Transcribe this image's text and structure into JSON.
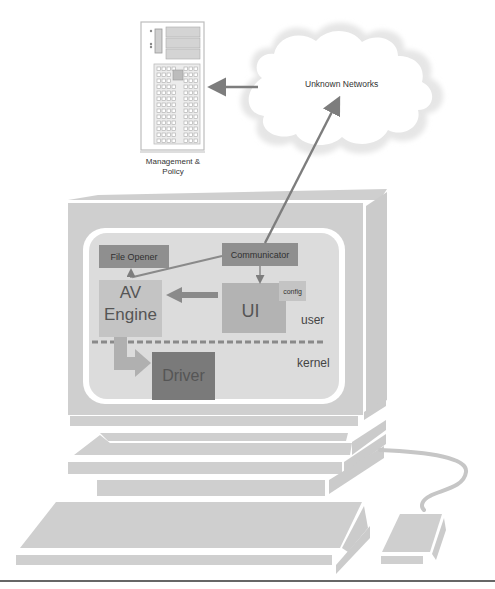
{
  "server": {
    "label_line1": "Management &",
    "label_line2": "Policy"
  },
  "cloud": {
    "label": "Unknown Networks"
  },
  "monitor": {
    "components": {
      "file_opener": "File Opener",
      "communicator": "Communicator",
      "av_engine_line1": "AV",
      "av_engine_line2": "Engine",
      "ui": "UI",
      "config": "config",
      "driver": "Driver"
    },
    "zones": {
      "user": "user",
      "kernel": "kernel"
    }
  },
  "colors": {
    "monitor_gray": "#cfcfcf",
    "screen_fill": "#dcdcdc",
    "box_dark": "#8f8f8f",
    "box_medium": "#b3b3b3",
    "box_light": "#c4c4c4",
    "driver_fill": "#7a7a7a",
    "arrow": "#808080",
    "dashed_line": "#8a8a8a",
    "text": "#333333"
  }
}
